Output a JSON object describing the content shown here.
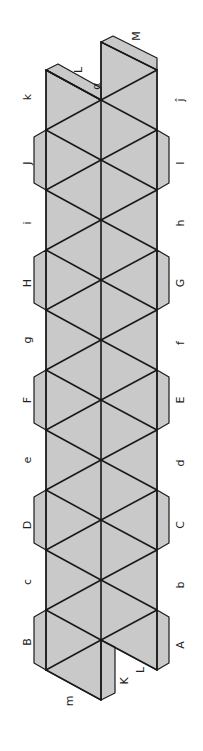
{
  "colors": {
    "face": "#c9c9c9",
    "edge": "#1a1a1a",
    "thin": "#444444",
    "background": "#ffffff"
  },
  "geometry": {
    "left_x": 46,
    "center_x": 101,
    "right_x": 157,
    "tab_width": 12,
    "side_vertices_y": [
      70,
      130,
      190,
      250,
      310,
      370,
      430,
      490,
      550,
      610
    ],
    "center_vertices_y": [
      100,
      160,
      220,
      280,
      340,
      400,
      460,
      520,
      580,
      640
    ],
    "top_center_y": 42,
    "bottom_center_y": 700,
    "bottom_left_y": 670
  },
  "labels": [
    {
      "id": "M",
      "text": "M",
      "x": 136,
      "y": 36
    },
    {
      "id": "L-top",
      "text": "L",
      "x": 78,
      "y": 70
    },
    {
      "id": "alpha",
      "text": "α",
      "x": 96,
      "y": 86
    },
    {
      "id": "k",
      "text": "k",
      "x": 27,
      "y": 97
    },
    {
      "id": "j",
      "text": "ĵ",
      "x": 180,
      "y": 100
    },
    {
      "id": "J",
      "text": "J",
      "x": 27,
      "y": 163
    },
    {
      "id": "I",
      "text": "I",
      "x": 180,
      "y": 163
    },
    {
      "id": "i",
      "text": "i",
      "x": 27,
      "y": 223
    },
    {
      "id": "h",
      "text": "h",
      "x": 180,
      "y": 223
    },
    {
      "id": "H",
      "text": "H",
      "x": 27,
      "y": 283
    },
    {
      "id": "G",
      "text": "G",
      "x": 180,
      "y": 283
    },
    {
      "id": "g",
      "text": "g",
      "x": 27,
      "y": 340
    },
    {
      "id": "f",
      "text": "f",
      "x": 180,
      "y": 343
    },
    {
      "id": "F",
      "text": "F",
      "x": 27,
      "y": 400
    },
    {
      "id": "E",
      "text": "E",
      "x": 180,
      "y": 400
    },
    {
      "id": "e",
      "text": "e",
      "x": 27,
      "y": 460
    },
    {
      "id": "d",
      "text": "d",
      "x": 180,
      "y": 463
    },
    {
      "id": "D",
      "text": "D",
      "x": 27,
      "y": 525
    },
    {
      "id": "C",
      "text": "C",
      "x": 180,
      "y": 525
    },
    {
      "id": "c",
      "text": "c",
      "x": 27,
      "y": 582
    },
    {
      "id": "b",
      "text": "b",
      "x": 180,
      "y": 585
    },
    {
      "id": "B",
      "text": "B",
      "x": 27,
      "y": 642
    },
    {
      "id": "A",
      "text": "A",
      "x": 180,
      "y": 645
    },
    {
      "id": "L-bottom",
      "text": "L",
      "x": 140,
      "y": 670
    },
    {
      "id": "K",
      "text": "K",
      "x": 124,
      "y": 681
    },
    {
      "id": "m",
      "text": "m",
      "x": 69,
      "y": 701
    }
  ]
}
